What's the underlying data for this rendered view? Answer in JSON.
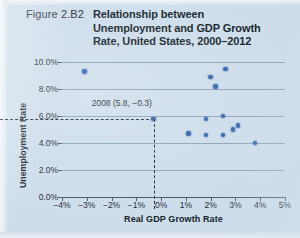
{
  "figure": {
    "number": "Figure 2.B2",
    "title_lines": [
      "Relationship between",
      "Unemployment and GDP Growth",
      "Rate, United States, 2000–2012"
    ]
  },
  "colors": {
    "background": "#ccdcea",
    "point": "#2a5fa8",
    "grid": "#7f95a8",
    "axis": "#45566a",
    "text": "#101b27"
  },
  "chart_data": {
    "type": "scatter",
    "title": "Relationship between Unemployment and GDP Growth Rate, United States, 2000–2012",
    "xlabel": "Real GDP Growth Rate",
    "ylabel": "Unemployment Rate",
    "xlim": [
      -4,
      5
    ],
    "ylim": [
      0,
      10
    ],
    "xticks": [
      -4,
      -3,
      -2,
      -1,
      0,
      1,
      2,
      3,
      4,
      5
    ],
    "xticklabels": [
      "−4%",
      "−3%",
      "−2%",
      "−1%",
      "0%",
      "1%",
      "2%",
      "3%",
      "4%",
      "5%"
    ],
    "yticks": [
      0,
      2,
      4,
      6,
      8,
      10
    ],
    "yticklabels": [
      "0.0%",
      "2.0%",
      "4.0%",
      "6.0%",
      "8.0%",
      "10.0%"
    ],
    "grid": "horizontal",
    "legend": "none",
    "points": [
      {
        "x": -3.1,
        "y": 9.3
      },
      {
        "x": 1.8,
        "y": 5.8
      },
      {
        "x": 1.1,
        "y": 4.7
      },
      {
        "x": 1.8,
        "y": 4.6
      },
      {
        "x": 2.0,
        "y": 8.9
      },
      {
        "x": 2.2,
        "y": 8.2
      },
      {
        "x": 2.5,
        "y": 4.6
      },
      {
        "x": 2.5,
        "y": 6.0
      },
      {
        "x": 2.6,
        "y": 9.5
      },
      {
        "x": 2.9,
        "y": 5.0
      },
      {
        "x": 3.1,
        "y": 5.3
      },
      {
        "x": 3.8,
        "y": 4.0
      },
      {
        "x": -0.3,
        "y": 5.8,
        "label": "2008"
      }
    ],
    "annotations": [
      {
        "text": "2008 (5.8, −0.3)",
        "x": -0.3,
        "y": 5.8,
        "guides": "dashed lines to both axes"
      }
    ]
  },
  "annotation_label": "2008 (5.8, −0.3)"
}
